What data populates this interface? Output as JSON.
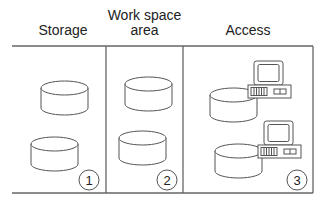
{
  "diagram": {
    "columns": [
      {
        "id": "storage",
        "header": [
          "Storage"
        ],
        "number": "1",
        "icon": "database-cylinder"
      },
      {
        "id": "workspace",
        "header": [
          "Work space",
          "area"
        ],
        "number": "2",
        "icon": "database-cylinder"
      },
      {
        "id": "access",
        "header": [
          "Access"
        ],
        "number": "3",
        "icon": "database-with-computer"
      }
    ],
    "colors": {
      "line": "#555555",
      "text": "#222222",
      "background": "#ffffff"
    }
  }
}
